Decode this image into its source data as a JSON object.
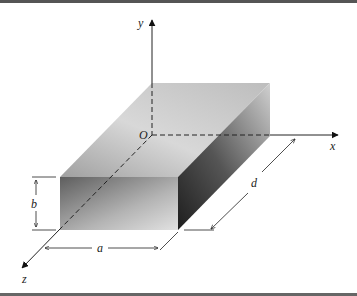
{
  "figure": {
    "type": "3d rectangular box with coordinate axes and dimensions",
    "axes": {
      "x": {
        "label": "x"
      },
      "y": {
        "label": "y"
      },
      "z": {
        "label": "z"
      },
      "origin": {
        "label": "O"
      }
    },
    "dimensions": {
      "width": {
        "label": "a"
      },
      "height": {
        "label": "b"
      },
      "depth": {
        "label": "d"
      }
    },
    "colors": {
      "border": "#555555",
      "line": "#222222",
      "top_face_light": "#e8e8e8",
      "top_face_dark": "#a8a8a8",
      "front_face_dark": "#6e6e6e",
      "front_face_light": "#d8d8d8",
      "side_face_dark": "#2e2e2e",
      "side_face_light": "#cfcfcf"
    }
  }
}
